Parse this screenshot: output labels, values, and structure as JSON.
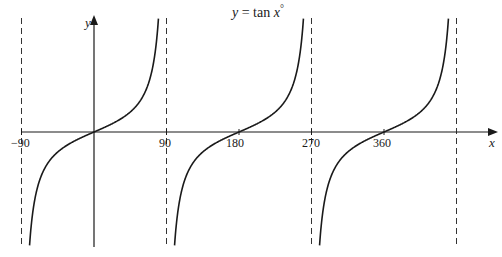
{
  "chart_data": {
    "type": "line",
    "title": "y = tan x°",
    "function": "tan",
    "xlabel": "x",
    "ylabel": "y",
    "x_unit": "degrees",
    "xlim": [
      -90,
      450
    ],
    "x_ticks": [
      -90,
      90,
      180,
      270,
      360
    ],
    "x_tick_labels": [
      "-90",
      "90",
      "180",
      "270",
      "360"
    ],
    "asymptotes_x": [
      -90,
      90,
      270,
      450
    ],
    "zeros_x": [
      0,
      180,
      360
    ],
    "branches": [
      {
        "from": -90,
        "to": 90
      },
      {
        "from": 90,
        "to": 270
      },
      {
        "from": 270,
        "to": 450
      }
    ],
    "grid": false,
    "legend": "none",
    "colors": {
      "curve": "#1a1a1a",
      "axes": "#1a1a1a",
      "asymptote": "#333333"
    }
  },
  "labels": {
    "title_y": "y",
    "title_eq": " = tan ",
    "title_x": "x",
    "title_deg": "°",
    "xaxis": "x",
    "yaxis": "y",
    "tick_m90": "−90",
    "tick_90": "90",
    "tick_180": "180",
    "tick_270": "270",
    "tick_360": "360"
  }
}
